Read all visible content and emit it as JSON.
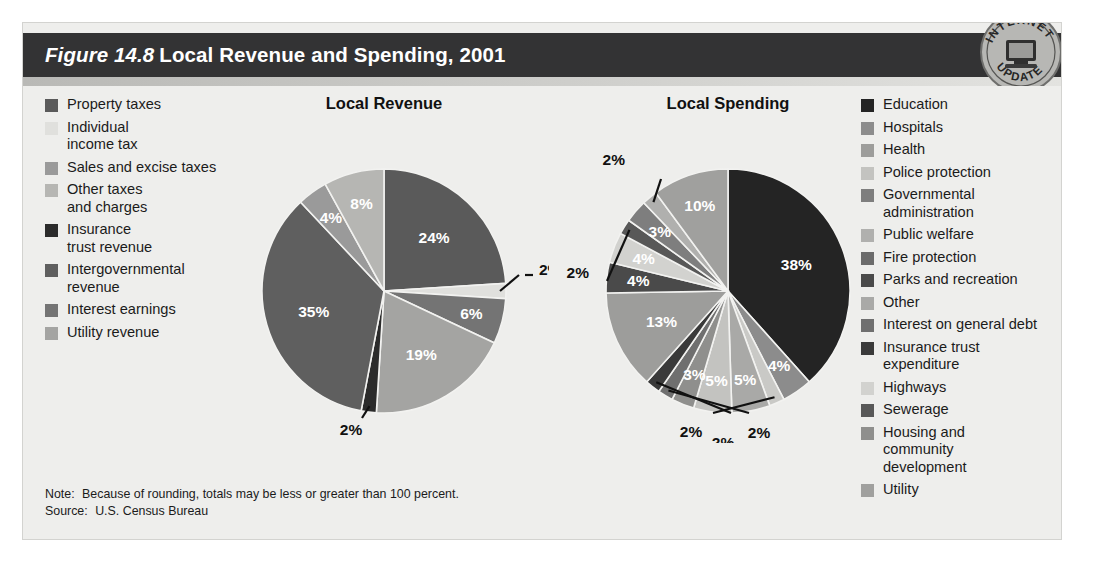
{
  "figure": {
    "number_label": "Figure 14.8",
    "title": "Local Revenue and Spending, 2001",
    "seal_top_text": "INTERNET",
    "seal_bottom_text": "UPDATE",
    "seal_icon": "computer-monitor-icon"
  },
  "footnote": {
    "note_key": "Note:",
    "note_text": "Because of rounding, totals may be less or greater than 100 percent.",
    "source_key": "Source:",
    "source_text": "U.S. Census Bureau"
  },
  "legend_left": {
    "items": [
      {
        "label": "Property taxes",
        "color": "#5a5a5a"
      },
      {
        "label": "Individual\nincome tax",
        "color": "#e0e0dd"
      },
      {
        "label": "Sales and excise taxes",
        "color": "#9a9a9a"
      },
      {
        "label": "Other taxes\nand charges",
        "color": "#b6b6b3"
      },
      {
        "label": "Insurance\ntrust revenue",
        "color": "#2b2b2b"
      },
      {
        "label": "Intergovernmental\nrevenue",
        "color": "#5f5f5f"
      },
      {
        "label": "Interest earnings",
        "color": "#747474"
      },
      {
        "label": "Utility revenue",
        "color": "#a4a4a2"
      }
    ]
  },
  "legend_right": {
    "items": [
      {
        "label": "Education",
        "color": "#242424"
      },
      {
        "label": "Hospitals",
        "color": "#8c8c8c"
      },
      {
        "label": "Health",
        "color": "#9d9d9b"
      },
      {
        "label": "Police protection",
        "color": "#c3c3c0"
      },
      {
        "label": "Governmental\nadministration",
        "color": "#7e7e7e"
      },
      {
        "label": "Public welfare",
        "color": "#b0b0ae"
      },
      {
        "label": "Fire protection",
        "color": "#6b6b6b"
      },
      {
        "label": "Parks and recreation",
        "color": "#4a4a4a"
      },
      {
        "label": "Other",
        "color": "#a9a9a7"
      },
      {
        "label": "Interest on general debt",
        "color": "#6f6f6f"
      },
      {
        "label": "Insurance trust\nexpenditure",
        "color": "#3a3a3a"
      },
      {
        "label": "Highways",
        "color": "#d2d2cf"
      },
      {
        "label": "Sewerage",
        "color": "#585858"
      },
      {
        "label": "Housing and\ncommunity\ndevelopment",
        "color": "#8f8f8d"
      },
      {
        "label": "Utility",
        "color": "#a0a09e"
      }
    ]
  },
  "chart_data": [
    {
      "type": "pie",
      "title": "Local Revenue",
      "categories": [
        "Property taxes",
        "Individual income tax",
        "Interest earnings",
        "Sales and excise taxes",
        "Insurance trust revenue",
        "Intergovernmental revenue",
        "Utility revenue",
        "Other taxes and charges"
      ],
      "values": [
        24,
        2,
        6,
        19,
        2,
        35,
        4,
        8
      ],
      "labels": [
        "24%",
        "2%",
        "6%",
        "19%",
        "2%",
        "35%",
        "4%",
        "8%"
      ],
      "colors": [
        "#5a5a5a",
        "#e0e0dd",
        "#747474",
        "#a4a4a2",
        "#2b2b2b",
        "#5f5f5f",
        "#9a9a9a",
        "#b6b6b3"
      ],
      "label_placement": [
        "inside",
        "callout-right",
        "inside",
        "inside",
        "callout-bottom",
        "inside",
        "inside",
        "inside"
      ],
      "legend_position": "left",
      "start_angle_deg": 0
    },
    {
      "type": "pie",
      "title": "Local Spending",
      "categories": [
        "Education",
        "Hospitals",
        "Sewerage",
        "Health",
        "Police protection",
        "Public welfare",
        "Interest on general debt",
        "Fire protection",
        "Parks and recreation",
        "Governmental administration",
        "Highways",
        "Insurance trust expenditure",
        "Housing and community development",
        "Utility",
        "Other"
      ],
      "values": [
        38,
        4,
        2,
        5,
        5,
        3,
        2,
        2,
        13,
        4,
        4,
        2,
        3,
        2,
        10
      ],
      "labels": [
        "38%",
        "4%",
        "2%",
        "5%",
        "5%",
        "3%",
        "2%",
        "2%",
        "13%",
        "4%",
        "4%",
        "2%",
        "3%",
        "2%",
        "10%"
      ],
      "colors": [
        "#242424",
        "#8c8c8c",
        "#c9c9c6",
        "#a9a9a7",
        "#c3c3c0",
        "#8f8f8d",
        "#6f6f6f",
        "#3a3a3a",
        "#9d9d9b",
        "#4a4a4a",
        "#d2d2cf",
        "#585858",
        "#7e7e7e",
        "#b0b0ae",
        "#a0a09e"
      ],
      "label_placement": [
        "inside",
        "inside",
        "callout-bottom",
        "inside",
        "inside",
        "inside",
        "callout-bottom",
        "callout-bottom",
        "inside",
        "inside",
        "inside",
        "callout-left",
        "inside",
        "callout-upper-left",
        "inside"
      ],
      "legend_position": "right",
      "start_angle_deg": 0
    }
  ]
}
